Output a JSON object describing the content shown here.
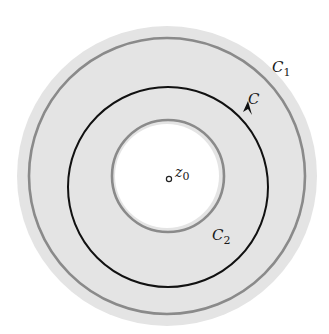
{
  "figure": {
    "colors": {
      "background": "#ffffff",
      "annulus_fill": "#e4e4e4",
      "inner_disk_fill": "#ffffff",
      "boundary_circles": "#8a8a8a",
      "contour": "#111111"
    },
    "center": {
      "x": 167,
      "y": 176
    },
    "shaded_region": {
      "outer_radius": 150,
      "inner_radius": 52
    },
    "circles": [
      {
        "name": "C1",
        "radius": 138,
        "stroke": "#8a8a8a"
      },
      {
        "name": "C",
        "radius": 100,
        "stroke": "#111111",
        "oriented": "counterclockwise"
      },
      {
        "name": "C2",
        "radius": 56,
        "stroke": "#8a8a8a"
      }
    ],
    "point": {
      "label_main": "z",
      "label_sub": "0"
    },
    "labels": {
      "c1": {
        "main": "C",
        "sub": "1"
      },
      "c": {
        "main": "C"
      },
      "c2": {
        "main": "C",
        "sub": "2"
      }
    }
  }
}
